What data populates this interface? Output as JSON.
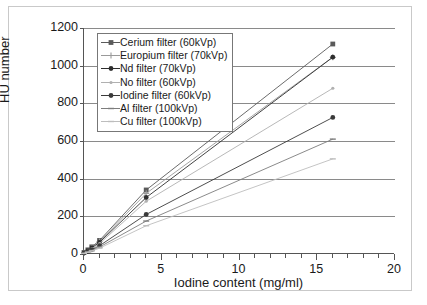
{
  "chart_data": {
    "type": "line",
    "title": "",
    "xlabel": "Iodine content (mg/ml)",
    "ylabel": "HU number",
    "xlim": [
      0,
      20
    ],
    "ylim": [
      0,
      1200
    ],
    "xticks": [
      0,
      5,
      10,
      15,
      20
    ],
    "xtick_labels": [
      "0",
      "5",
      "10",
      "15",
      "20"
    ],
    "x_minor_tick_step": 1,
    "yticks": [
      0,
      200,
      400,
      600,
      800,
      1000,
      1200
    ],
    "ytick_labels": [
      "0",
      "200",
      "400",
      "600",
      "800",
      "1000",
      "1200"
    ],
    "grid": "horizontal",
    "legend_position": "upper-left-inside",
    "x": [
      0,
      0.25,
      0.5,
      1,
      4,
      16
    ],
    "series": [
      {
        "name": "Cerium filter (60kVp)",
        "values": [
          8,
          22,
          38,
          72,
          340,
          1115
        ],
        "color": "#5a5a5a",
        "marker": "square"
      },
      {
        "name": "Europium filter (70kVp)",
        "values": [
          7,
          20,
          35,
          66,
          322,
          1045
        ],
        "color": "#9a9a9a",
        "marker": "plus"
      },
      {
        "name": "Nd filter (70kVp)",
        "values": [
          6,
          18,
          32,
          62,
          300,
          1045
        ],
        "color": "#2e2e2e",
        "marker": "circle"
      },
      {
        "name": "No filter (60kVp)",
        "values": [
          6,
          16,
          28,
          55,
          280,
          880
        ],
        "color": "#b0b0b0",
        "marker": "dot"
      },
      {
        "name": "Iodine filter (60kVp)",
        "values": [
          5,
          13,
          22,
          44,
          210,
          725
        ],
        "color": "#3a3a3a",
        "marker": "circle"
      },
      {
        "name": "Al filter (100kVp)",
        "values": [
          4,
          11,
          19,
          37,
          175,
          610
        ],
        "color": "#7d7d7d",
        "marker": "dash"
      },
      {
        "name": "Cu filter (100kVp)",
        "values": [
          3,
          9,
          16,
          31,
          150,
          505
        ],
        "color": "#bdbdbd",
        "marker": "dash"
      }
    ]
  }
}
